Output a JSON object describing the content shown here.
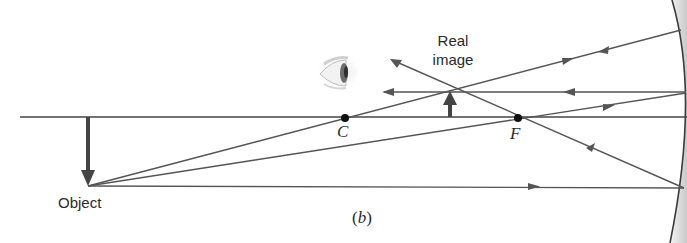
{
  "figure": {
    "caption_open": "(",
    "caption_letter": "b",
    "caption_close": ")",
    "labels": {
      "object": "Object",
      "real_image_line1": "Real",
      "real_image_line2": "image",
      "center_of_curvature": "C",
      "focal_point": "F"
    },
    "colors": {
      "ray": "#555555",
      "axis": "#444444",
      "arrow": "#444444",
      "mirror_shade": "#d9d9d9",
      "text": "#2a2a2a"
    },
    "elements": {
      "mirror": "concave-mirror",
      "eye": "observer-eye-icon",
      "object_arrow": "inverted object arrow below principal axis",
      "image_arrow": "upright real image arrow above principal axis"
    }
  }
}
